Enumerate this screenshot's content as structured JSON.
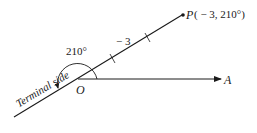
{
  "diagram": {
    "point_label": "P",
    "point_coords": "( − 3, 210°)",
    "angle_label": "210°",
    "distance_label": "− 3",
    "origin_label": "O",
    "axis_label": "A",
    "terminal_side_label": "Terminal side",
    "colors": {
      "line": "#1a1a1a",
      "background": "#ffffff"
    }
  }
}
